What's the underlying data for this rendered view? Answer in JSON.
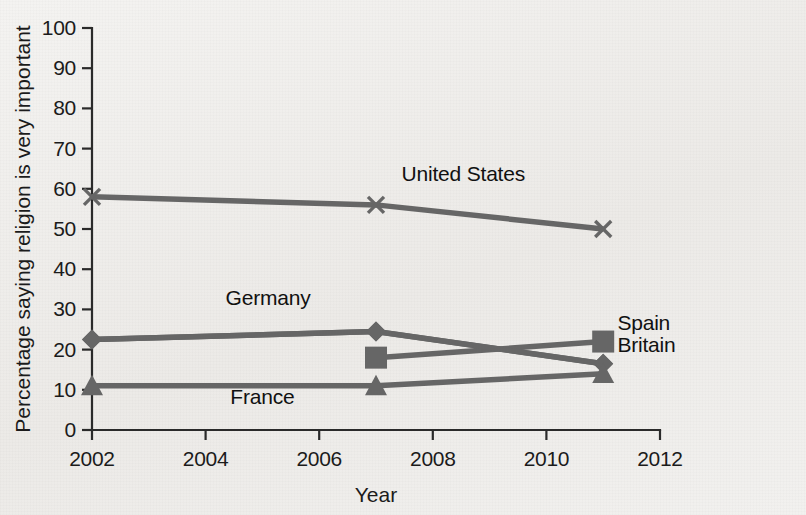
{
  "chart_data": {
    "type": "line",
    "title": "",
    "xlabel": "Year",
    "ylabel": "Percentage saying religion is very important",
    "xlim": [
      2002,
      2012
    ],
    "ylim": [
      0,
      100
    ],
    "grid": false,
    "legend_position": "inline-labels",
    "x_ticks": [
      "2002",
      "2004",
      "2006",
      "2008",
      "2010",
      "2012"
    ],
    "x_tick_values": [
      2002,
      2004,
      2006,
      2008,
      2010,
      2012
    ],
    "y_ticks": [
      "0",
      "10",
      "20",
      "30",
      "40",
      "50",
      "60",
      "70",
      "80",
      "90",
      "100"
    ],
    "y_tick_values": [
      0,
      10,
      20,
      30,
      40,
      50,
      60,
      70,
      80,
      90,
      100
    ],
    "series": [
      {
        "name": "United States",
        "marker": "x",
        "label_x": 2007.45,
        "label_y": 62,
        "label_anchor": "start",
        "x": [
          2002,
          2007,
          2011
        ],
        "values": [
          58,
          56,
          50
        ]
      },
      {
        "name": "Germany",
        "marker": "diamond",
        "label_x": 2005.1,
        "label_y": 31,
        "label_anchor": "middle",
        "x": [
          2002,
          2007,
          2011
        ],
        "values": [
          22.5,
          24.5,
          16.5
        ]
      },
      {
        "name": "Spain",
        "marker": "square",
        "label_x": 2011.25,
        "label_y": 25,
        "label_anchor": "start",
        "x": [
          2007,
          2011
        ],
        "values": [
          18,
          22
        ]
      },
      {
        "name": "Britain",
        "marker": "diamond",
        "label_x": 2011.25,
        "label_y": 19.5,
        "label_anchor": "start",
        "x": [
          2002,
          2007,
          2011
        ],
        "values": [
          22.5,
          24.5,
          16.5
        ]
      },
      {
        "name": "France",
        "marker": "triangle",
        "label_x": 2005.0,
        "label_y": 6.5,
        "label_anchor": "middle",
        "x": [
          2002,
          2007,
          2011
        ],
        "values": [
          11,
          11,
          14
        ]
      }
    ],
    "colors": {
      "line": "#666666",
      "axis": "#2a2a2a",
      "text": "#1b1b1b",
      "background": "#f1f0ee"
    }
  }
}
